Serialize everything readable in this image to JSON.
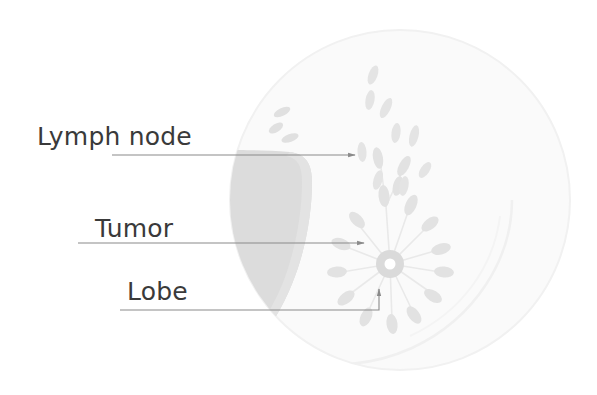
{
  "figure": {
    "width": 597,
    "height": 395,
    "background_color": "#ffffff"
  },
  "labels": [
    {
      "id": "lymph-node",
      "text": "Lymph node",
      "leader_line": {
        "from_x": 112,
        "from_y": 155,
        "to_x": 357,
        "to_y": 155,
        "has_arrowhead": true
      }
    },
    {
      "id": "tumor",
      "text": "Tumor",
      "leader_line": {
        "from_x": 78,
        "from_y": 243,
        "to_x": 366,
        "to_y": 243,
        "has_arrowhead": true
      }
    },
    {
      "id": "lobe",
      "text": "Lobe",
      "leader_line": {
        "from_x": 120,
        "from_y": 310,
        "to_x": 379,
        "to_y": 310,
        "has_arrowhead": true,
        "elbow_up_to_y": 288
      }
    }
  ],
  "anatomy": {
    "outer_circle": {
      "name": "breast-outline",
      "cx": 400,
      "cy": 200,
      "r": 170,
      "fill": "#fafafa",
      "stroke": "#f0f0f0"
    },
    "inner_arc": {
      "name": "breast-tissue-boundary",
      "stroke": "#f2f2f2"
    },
    "chest_wall": {
      "name": "chest-wall-muscle",
      "fill": "#dcdcdc",
      "description": "darker crescent region on the left side"
    },
    "nipple": {
      "name": "nipple",
      "cx": 390,
      "cy": 264,
      "outer_r": 14,
      "inner_r": 5,
      "ring_fill": "#dadada",
      "center_fill": "#ffffff"
    },
    "lobes": {
      "name": "lobe-cluster",
      "count": 12,
      "fill": "#e2e2e2",
      "duct_stroke": "#e8e8e8",
      "description": "teardrop shaped lobes radiating from the nipple with duct lines"
    },
    "lymph_nodes": {
      "name": "lymph-node-chain",
      "count": 9,
      "fill": "#e4e4e4",
      "description": "chain of small elongated oval nodes in the upper inner breast"
    }
  },
  "colors": {
    "text": "#3a3a3a",
    "leader_line": "#8a8a8a",
    "breast_fill": "#fafafa",
    "chest_wall_fill": "#dcdcdc",
    "lobe_fill": "#e2e2e2",
    "nipple_fill": "#dadada"
  }
}
